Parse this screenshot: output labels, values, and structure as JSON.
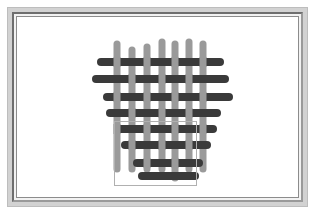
{
  "page": {
    "background_color": "#ffffff"
  },
  "frame": {
    "name": "picture-frame",
    "outer_fill": "#d2d2d2",
    "outer_border": "#bdbdbd",
    "bevel_dark": "#6e6e6e",
    "bevel_light": "#9a9a9a",
    "inner_fill": "#f2f2f2",
    "plate_fill": "#ffffff",
    "plate_border": "#8c8c8c"
  },
  "figure": {
    "name": "plain-weave-lattice",
    "canvas": {
      "width": 281,
      "height": 180
    },
    "colors": {
      "vertical_bar": "#9a9a9a",
      "horizontal_bar": "#3a3a3a",
      "crossing_overlap": "#5c5c5c",
      "outline_rect_stroke": "#b0b0b0",
      "background": "#ffffff"
    },
    "vertical_bars": {
      "count": 7,
      "thickness": 7,
      "cap": "round",
      "color": "#9a9a9a",
      "items": [
        {
          "index": 1,
          "x": 100,
          "y_top": 27,
          "y_bottom": 152
        },
        {
          "index": 2,
          "x": 115,
          "y_top": 33,
          "y_bottom": 152
        },
        {
          "index": 3,
          "x": 130,
          "y_top": 30,
          "y_bottom": 152
        },
        {
          "index": 4,
          "x": 145,
          "y_top": 25,
          "y_bottom": 152
        },
        {
          "index": 5,
          "x": 158,
          "y_top": 27,
          "y_bottom": 161
        },
        {
          "index": 6,
          "x": 172,
          "y_top": 25,
          "y_bottom": 152
        },
        {
          "index": 7,
          "x": 186,
          "y_top": 27,
          "y_bottom": 152
        }
      ]
    },
    "horizontal_bars": {
      "count": 8,
      "thickness": 8,
      "cap": "round",
      "color": "#3a3a3a",
      "items": [
        {
          "index": 1,
          "y": 45,
          "x_left": 84,
          "x_right": 203
        },
        {
          "index": 2,
          "y": 62,
          "x_left": 79,
          "x_right": 208
        },
        {
          "index": 3,
          "y": 80,
          "x_left": 90,
          "x_right": 212
        },
        {
          "index": 4,
          "y": 96,
          "x_left": 93,
          "x_right": 200
        },
        {
          "index": 5,
          "y": 112,
          "x_left": 101,
          "x_right": 196
        },
        {
          "index": 6,
          "y": 128,
          "x_left": 108,
          "x_right": 190
        },
        {
          "index": 7,
          "y": 146,
          "x_left": 120,
          "x_right": 182
        },
        {
          "index": 8,
          "y": 159,
          "x_left": 125,
          "x_right": 178
        }
      ]
    },
    "outline_rect": {
      "name": "selection-rectangle",
      "x": 97,
      "y": 104,
      "width": 82,
      "height": 64,
      "stroke": "#b0b0b0",
      "stroke_width": 1,
      "fill": "none"
    }
  }
}
